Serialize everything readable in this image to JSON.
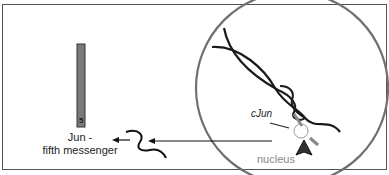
{
  "diagram": {
    "messenger_label_line1": "Jun -",
    "messenger_label_line2": "fifth messenger",
    "bar_number": "5",
    "gene_label": "cJun",
    "compartment_label": "nucleus",
    "colors": {
      "bar_fill": "#7a7a7a",
      "circle_stroke": "#707070",
      "dna_stroke": "#1a1a1a",
      "nucleus_text": "#888888"
    }
  }
}
